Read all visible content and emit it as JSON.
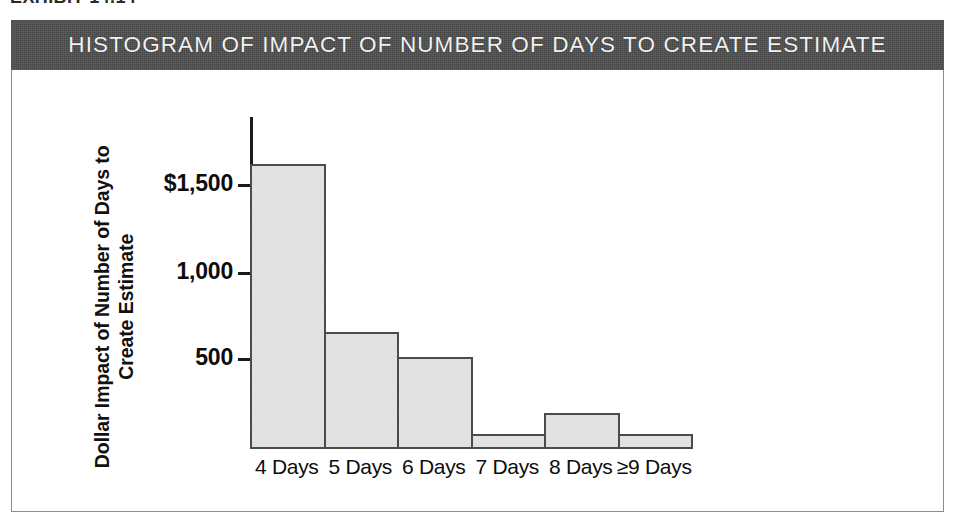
{
  "exhibit": {
    "label": "EXHIBIT 14.14"
  },
  "title_bar": {
    "text": "HISTOGRAM OF IMPACT OF NUMBER OF DAYS TO CREATE ESTIMATE",
    "background_color": "#4e4e4e",
    "text_color": "#f2f2f2"
  },
  "axis": {
    "y_title_line1": "Dollar Impact of Number of Days to",
    "y_title_line2": "Create Estimate",
    "tick_labels": [
      "$1,500",
      "1,000",
      "500"
    ]
  },
  "colors": {
    "bar_fill": "#e3e3e3",
    "bar_stroke": "#4b4b4b",
    "axis": "#1a1a1a",
    "frame": "#8d8d8d"
  },
  "chart_data": {
    "type": "bar",
    "title": "HISTOGRAM OF IMPACT OF NUMBER OF DAYS TO CREATE ESTIMATE",
    "xlabel": "",
    "ylabel": "Dollar Impact of Number of Days to Create Estimate",
    "categories": [
      "4 Days",
      "5 Days",
      "6 Days",
      "7 Days",
      "8 Days",
      "≥9 Days"
    ],
    "values": [
      1600,
      645,
      505,
      70,
      190,
      70
    ],
    "yticks": [
      500,
      1000,
      1500
    ],
    "ytick_labels": [
      "500",
      "1,000",
      "$1,500"
    ],
    "ylim": [
      0,
      1900
    ],
    "grid": false,
    "legend": "none"
  }
}
